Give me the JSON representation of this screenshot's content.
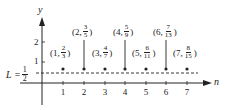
{
  "axes": {
    "x_label": "n",
    "y_label": "y",
    "y_ticks": [
      "1",
      "2"
    ],
    "x_ticks": [
      "1",
      "2",
      "3",
      "4",
      "5",
      "6",
      "7"
    ]
  },
  "limit": {
    "prefix": "L =",
    "num": "1",
    "den": "2"
  },
  "points": [
    {
      "n": "1",
      "num": "2",
      "den": "3"
    },
    {
      "n": "2",
      "num": "3",
      "den": "5"
    },
    {
      "n": "3",
      "num": "4",
      "den": "7"
    },
    {
      "n": "4",
      "num": "5",
      "den": "9"
    },
    {
      "n": "5",
      "num": "6",
      "den": "11"
    },
    {
      "n": "6",
      "num": "7",
      "den": "13"
    },
    {
      "n": "7",
      "num": "8",
      "den": "15"
    }
  ],
  "colors": {
    "ink": "#222222",
    "background": "#ffffff"
  }
}
